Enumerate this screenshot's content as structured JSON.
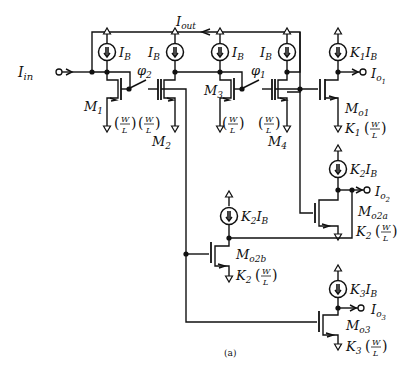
{
  "figure": {
    "caption": "(a)"
  },
  "labels": {
    "i_in": "I",
    "i_in_sub": "in",
    "i_out": "I",
    "i_out_sub": "out",
    "ib": "I",
    "ib_sub": "B",
    "k1ib_k": "K",
    "k1ib_ksub": "1",
    "k2ib_k": "K",
    "k2ib_ksub": "2",
    "k3ib_k": "K",
    "k3ib_ksub": "3",
    "phi": "φ",
    "phi1_sub": "1",
    "phi2_sub": "2",
    "m": "M",
    "m1_sub": "1",
    "m2_sub": "2",
    "m3_sub": "3",
    "m4_sub": "4",
    "mo1_sub": "o1",
    "mo2a_sub": "o2a",
    "mo2b_sub": "o2b",
    "mo3_sub": "o3",
    "io": "I",
    "io1_sub": "o",
    "io1_subsub": "1",
    "io2_subsub": "2",
    "io3_subsub": "3",
    "wl_w": "W",
    "wl_l": "L",
    "k1_ratio": "K",
    "k1_ratio_sub": "1",
    "k2_ratio_sub": "2",
    "k3_ratio_sub": "3"
  },
  "components": {
    "transistors": [
      "M1",
      "M2",
      "M3",
      "M4",
      "Mo1",
      "Mo2a",
      "Mo2b",
      "Mo3"
    ],
    "current_sources": [
      "IB",
      "IB",
      "IB",
      "IB",
      "K1 IB",
      "K2 IB",
      "K2 IB",
      "K3 IB"
    ],
    "switches": [
      "phi2",
      "phi1"
    ],
    "ports": [
      "Iin",
      "Iout",
      "Io1",
      "Io2",
      "Io3"
    ]
  },
  "colors": {
    "ink": "#111111",
    "background": "#ffffff"
  }
}
